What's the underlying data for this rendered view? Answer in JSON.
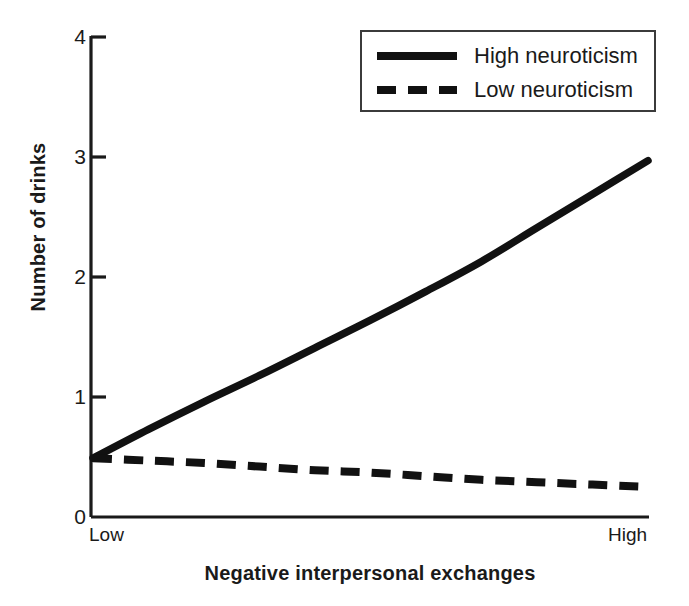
{
  "chart_data": {
    "type": "line",
    "title": "",
    "xlabel": "Negative interpersonal exchanges",
    "ylabel": "Number of drinks",
    "xlim": [
      0,
      1
    ],
    "ylim": [
      0,
      4
    ],
    "x_tick_labels": [
      "Low",
      "High"
    ],
    "y_tick_labels": [
      "0",
      "1",
      "2",
      "3",
      "4"
    ],
    "y_ticks": [
      0,
      1,
      2,
      3,
      4
    ],
    "grid": false,
    "legend_position": "top-right",
    "x": [
      0,
      0.1,
      0.2,
      0.3,
      0.4,
      0.5,
      0.6,
      0.7,
      0.8,
      0.9,
      1.0
    ],
    "series": [
      {
        "name": "High neuroticism",
        "style": "solid",
        "color": "#111111",
        "values": [
          0.49,
          0.73,
          0.96,
          1.18,
          1.41,
          1.64,
          1.88,
          2.13,
          2.41,
          2.69,
          2.97
        ]
      },
      {
        "name": "Low neuroticism",
        "style": "dashed",
        "color": "#111111",
        "values": [
          0.49,
          0.47,
          0.45,
          0.42,
          0.39,
          0.37,
          0.34,
          0.31,
          0.29,
          0.27,
          0.25
        ]
      }
    ]
  },
  "axis": {
    "y_tick_labels": [
      "4",
      "3",
      "2",
      "1",
      "0"
    ],
    "x_low_label": "Low",
    "x_high_label": "High",
    "y_title": "Number of drinks",
    "x_title": "Negative interpersonal exchanges"
  },
  "legend": {
    "items": [
      {
        "label": "High neuroticism",
        "style": "solid"
      },
      {
        "label": "Low neuroticism",
        "style": "dashed"
      }
    ]
  },
  "colors": {
    "line": "#111111",
    "axis": "#1a1a1a",
    "legend_border": "#3b3b3b",
    "background": "#ffffff"
  }
}
